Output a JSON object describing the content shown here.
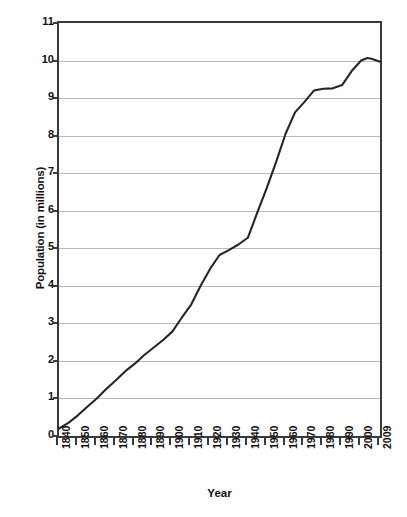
{
  "chart_data": {
    "type": "line",
    "title": "",
    "subtitle": "",
    "xlabel": "Year",
    "ylabel": "Population (in millions)",
    "xlim": [
      1840,
      2009
    ],
    "ylim": [
      0,
      11
    ],
    "grid": true,
    "legend": false,
    "line_color": "#262626",
    "grid_color": "#b9b9b9",
    "axis_color": "#3a3a3a",
    "x_tick_labels": [
      "1840",
      "1850",
      "1860",
      "1870",
      "1880",
      "1890",
      "1900",
      "1910",
      "1920",
      "1930",
      "1940",
      "1950",
      "1960",
      "1970",
      "1980",
      "1990",
      "2000",
      "2009"
    ],
    "y_tick_labels": [
      "0",
      "1",
      "2",
      "3",
      "4",
      "5",
      "6",
      "7",
      "8",
      "9",
      "10",
      "11"
    ],
    "y_ticks": [
      0,
      1,
      2,
      3,
      4,
      5,
      6,
      7,
      8,
      9,
      10,
      11
    ],
    "x": [
      1840,
      1845,
      1850,
      1855,
      1860,
      1865,
      1870,
      1875,
      1880,
      1885,
      1890,
      1895,
      1900,
      1905,
      1910,
      1915,
      1920,
      1925,
      1930,
      1935,
      1940,
      1945,
      1950,
      1955,
      1960,
      1965,
      1970,
      1975,
      1980,
      1985,
      1990,
      1995,
      2000,
      2003,
      2005,
      2009
    ],
    "values": [
      0.2,
      0.35,
      0.55,
      0.78,
      1.0,
      1.25,
      1.48,
      1.72,
      1.92,
      2.15,
      2.35,
      2.55,
      2.78,
      3.15,
      3.5,
      4.0,
      4.45,
      4.82,
      4.95,
      5.1,
      5.28,
      5.95,
      6.6,
      7.3,
      8.05,
      8.62,
      8.9,
      9.2,
      9.25,
      9.26,
      9.35,
      9.72,
      10.0,
      10.07,
      10.05,
      9.97
    ],
    "annotations": []
  }
}
